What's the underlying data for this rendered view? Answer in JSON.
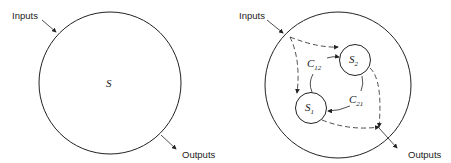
{
  "left_diagram": {
    "inputs_label": "Inputs",
    "outputs_label": "Outputs",
    "system_label": "S"
  },
  "right_diagram": {
    "inputs_label": "Inputs",
    "outputs_label": "Outputs",
    "subsystem_1": {
      "main": "S",
      "sub": "1"
    },
    "subsystem_2": {
      "main": "S",
      "sub": "2"
    },
    "coupling_12": {
      "main": "C",
      "sub": "12"
    },
    "coupling_21": {
      "main": "C",
      "sub": "21"
    }
  },
  "colors": {
    "stroke": "#222222",
    "background": "#ffffff"
  }
}
